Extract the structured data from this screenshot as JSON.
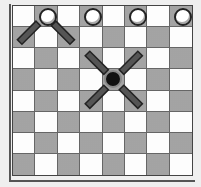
{
  "board": {
    "rows": 8,
    "cols": 8,
    "colors": {
      "light": "#fdfdfd",
      "dark": "#b4b4b4",
      "frame": "#555555"
    },
    "pieces": [
      {
        "type": "white-disc",
        "row": 0,
        "col": 1
      },
      {
        "type": "white-disc",
        "row": 0,
        "col": 3
      },
      {
        "type": "white-disc",
        "row": 0,
        "col": 5
      },
      {
        "type": "white-disc",
        "row": 0,
        "col": 7
      },
      {
        "type": "black-disc",
        "row": 3,
        "col": 4
      }
    ],
    "move_indicators": [
      {
        "from": [
          0,
          1
        ],
        "directions": [
          "down-left",
          "down-right"
        ]
      },
      {
        "from": [
          3,
          4
        ],
        "directions": [
          "up-left",
          "up-right",
          "down-left",
          "down-right"
        ]
      }
    ]
  }
}
